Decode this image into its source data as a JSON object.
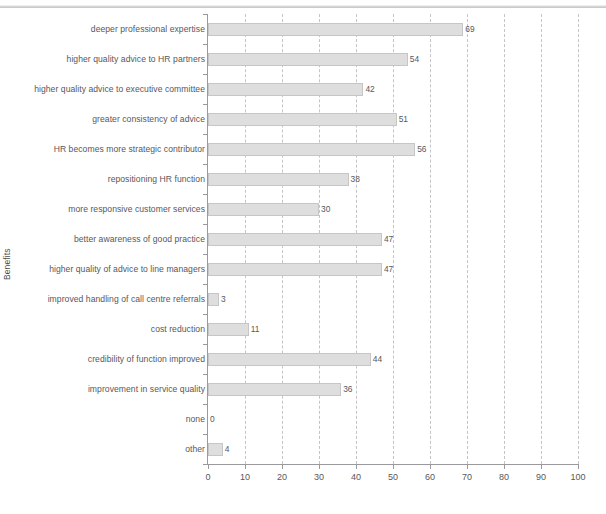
{
  "chart_data": {
    "type": "bar",
    "orientation": "horizontal",
    "title": "",
    "xlabel": "",
    "ylabel": "Benefits",
    "xlim": [
      0,
      100
    ],
    "xticks": [
      0,
      10,
      20,
      30,
      40,
      50,
      60,
      70,
      80,
      90,
      100
    ],
    "grid": true,
    "grid_axis": "x",
    "grid_style": "dashed",
    "legend": false,
    "bar_color": "#dedede",
    "bar_edge_color": "#c6c6c6",
    "axis_color": "#9a9a9e",
    "text_color": "#58585a",
    "data_labels": true,
    "categories": [
      "deeper professional expertise",
      "higher quality advice to HR partners",
      "higher quality advice to executive committee",
      "greater consistency of advice",
      "HR becomes more strategic contributor",
      "repositioning HR function",
      "more responsive customer services",
      "better awareness of good practice",
      "higher quality of advice to line managers",
      "improved handling of call centre referrals",
      "cost reduction",
      "credibility of function improved",
      "improvement in service quality",
      "none",
      "other"
    ],
    "values": [
      69,
      54,
      42,
      51,
      56,
      38,
      30,
      47,
      47,
      3,
      11,
      44,
      36,
      0,
      4
    ],
    "value_labels": [
      "69",
      "54",
      "42",
      "51",
      "56",
      "38",
      "30",
      "47",
      "47",
      "3",
      "11",
      "44",
      "36",
      "0",
      "4"
    ]
  }
}
